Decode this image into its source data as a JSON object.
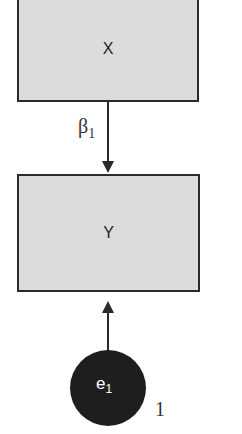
{
  "diagram": {
    "nodes": [
      {
        "id": "X",
        "label": "X",
        "shape": "rectangle"
      },
      {
        "id": "Y",
        "label": "Y",
        "shape": "rectangle"
      },
      {
        "id": "e1",
        "label_main": "e",
        "label_sub": "1",
        "shape": "circle",
        "variance_label": "1"
      }
    ],
    "edges": [
      {
        "from": "X",
        "to": "Y",
        "label_main": "β",
        "label_sub": "1"
      },
      {
        "from": "e1",
        "to": "Y",
        "label": ""
      }
    ]
  }
}
